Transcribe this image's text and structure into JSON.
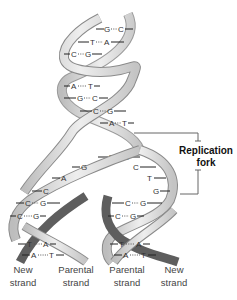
{
  "figure": {
    "annotation": {
      "label_line1": "Replication",
      "label_line2": "fork"
    },
    "strand_labels": [
      {
        "line1": "New",
        "line2": "strand"
      },
      {
        "line1": "Parental",
        "line2": "strand"
      },
      {
        "line1": "Parental",
        "line2": "strand"
      },
      {
        "line1": "New",
        "line2": "strand"
      }
    ],
    "base_pairs_parental_helix": [
      {
        "left": "G",
        "right": "C"
      },
      {
        "left": "T",
        "right": "A"
      },
      {
        "left": "C",
        "right": "G"
      },
      {
        "left": "A",
        "right": "T"
      },
      {
        "left": "G",
        "right": "C"
      },
      {
        "left": "C",
        "right": "G"
      },
      {
        "left": "A",
        "right": "T"
      },
      {
        "left": "T",
        "right": "A"
      }
    ],
    "unpaired_left": [
      "G",
      "A",
      "C"
    ],
    "unpaired_right": [
      "C",
      "T",
      "G"
    ],
    "left_daughter_pairs": [
      {
        "left": "C",
        "right": "G"
      },
      {
        "left": "C",
        "right": "G"
      },
      {
        "left": "T",
        "right": "A"
      },
      {
        "left": "A",
        "right": "T"
      }
    ],
    "right_daughter_pairs": [
      {
        "left": "C",
        "right": "G"
      },
      {
        "left": "C",
        "right": "G"
      },
      {
        "left": "T",
        "right": "A"
      },
      {
        "left": "A",
        "right": "T"
      }
    ],
    "colors": {
      "parental_strand": "#d9d9d9",
      "parental_edge": "#8a8a8a",
      "new_strand": "#5e5e5e",
      "bracket": "#666666"
    }
  }
}
